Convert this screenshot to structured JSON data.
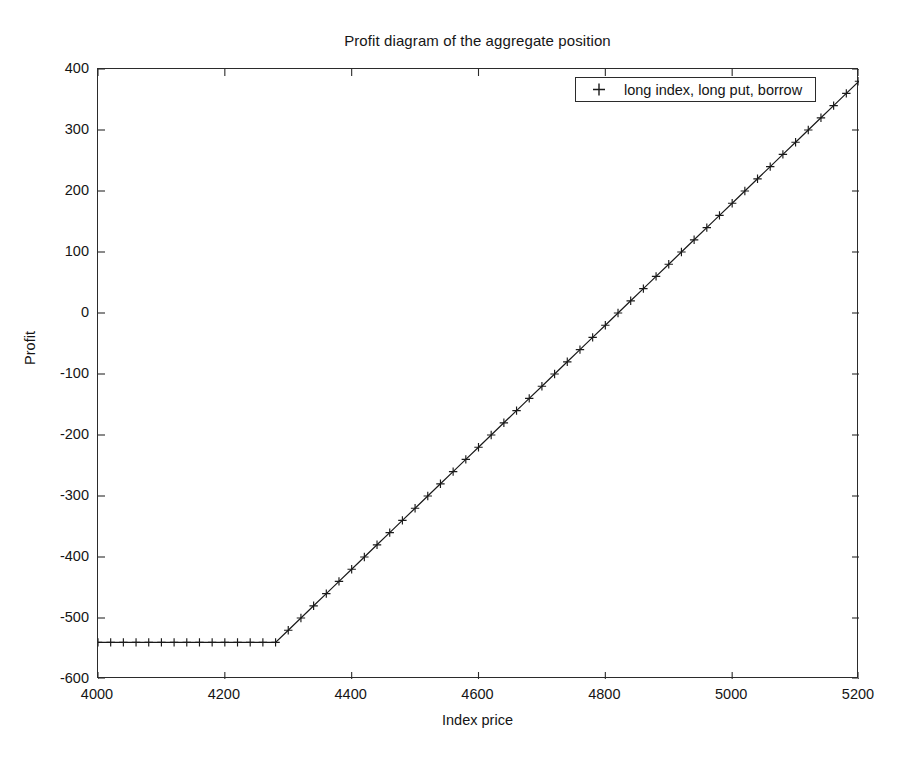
{
  "chart_data": {
    "type": "line",
    "title": "Profit diagram of the aggregate position",
    "xlabel": "Index price",
    "ylabel": "Profit",
    "xlim": [
      4000,
      5200
    ],
    "ylim": [
      -600,
      400
    ],
    "xticks": [
      4000,
      4200,
      4400,
      4600,
      4800,
      5000,
      5200
    ],
    "xtick_labels": [
      "4000",
      "4200",
      "4400",
      "4600",
      "4800",
      "5000",
      "5200"
    ],
    "yticks": [
      -600,
      -500,
      -400,
      -300,
      -200,
      -100,
      0,
      100,
      200,
      300,
      400
    ],
    "ytick_labels": [
      "-600",
      "-500",
      "-400",
      "-300",
      "-200",
      "-100",
      "0",
      "100",
      "200",
      "300",
      "400"
    ],
    "grid": false,
    "legend_position": "upper right",
    "marker": "+",
    "line_color": "#1a1a1a",
    "series": [
      {
        "name": "long index, long put, borrow",
        "marker": "+",
        "description": "Piecewise linear payoff: flat at -540 below the strike 4280, then rising with slope 1",
        "breakpoints": [
          {
            "x": 4000,
            "y": -540
          },
          {
            "x": 4280,
            "y": -540
          },
          {
            "x": 5200,
            "y": 380
          }
        ],
        "x": [
          4000,
          4020,
          4040,
          4060,
          4080,
          4100,
          4120,
          4140,
          4160,
          4180,
          4200,
          4220,
          4240,
          4260,
          4280,
          4300,
          4320,
          4340,
          4360,
          4380,
          4400,
          4420,
          4440,
          4460,
          4480,
          4500,
          4520,
          4540,
          4560,
          4580,
          4600,
          4620,
          4640,
          4660,
          4680,
          4700,
          4720,
          4740,
          4760,
          4780,
          4800,
          4820,
          4840,
          4860,
          4880,
          4900,
          4920,
          4940,
          4960,
          4980,
          5000,
          5020,
          5040,
          5060,
          5080,
          5100,
          5120,
          5140,
          5160,
          5180,
          5200
        ],
        "values": [
          -540,
          -540,
          -540,
          -540,
          -540,
          -540,
          -540,
          -540,
          -540,
          -540,
          -540,
          -540,
          -540,
          -540,
          -540,
          -520,
          -500,
          -480,
          -460,
          -440,
          -420,
          -400,
          -380,
          -360,
          -340,
          -320,
          -300,
          -280,
          -260,
          -240,
          -220,
          -200,
          -180,
          -160,
          -140,
          -120,
          -100,
          -80,
          -60,
          -40,
          -20,
          0,
          20,
          40,
          60,
          80,
          100,
          120,
          140,
          160,
          180,
          200,
          220,
          240,
          260,
          280,
          300,
          320,
          340,
          360,
          380
        ]
      }
    ],
    "annotations": {
      "strike": 4280,
      "floor_profit": -540,
      "breakeven": 4820,
      "max_shown_profit": 380
    }
  },
  "legend": {
    "entries": [
      {
        "marker_icon": "plus-marker",
        "label": "long index, long put, borrow"
      }
    ]
  }
}
